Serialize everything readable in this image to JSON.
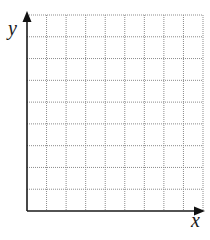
{
  "diagram": {
    "type": "blank coordinate grid (first quadrant)",
    "x_axis_label": "x",
    "y_axis_label": "y",
    "grid": {
      "columns": 9,
      "rows": 9,
      "line_style": "dotted",
      "line_color": "#8c8c8c"
    },
    "axis_color": "#1a1a1a",
    "background": "#ffffff"
  }
}
